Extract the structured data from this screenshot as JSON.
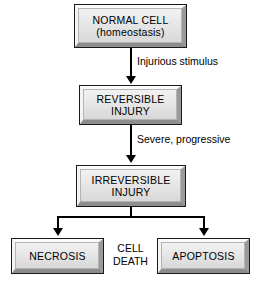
{
  "diagram": {
    "type": "flowchart",
    "colors": {
      "box_fill": "#e9e9e9",
      "box_border": "#1a1a1a",
      "bevel_light": "#fbfbfb",
      "bevel_dark": "#8d8d8d",
      "connector": "#000000",
      "text": "#000000",
      "background": "#ffffff"
    },
    "nodes": [
      {
        "id": "normal-cell",
        "label": "NORMAL CELL\n(homeostasis)"
      },
      {
        "id": "reversible-injury",
        "label": "REVERSIBLE\nINJURY"
      },
      {
        "id": "irreversible-injury",
        "label": "IRREVERSIBLE\nINJURY"
      },
      {
        "id": "necrosis",
        "label": "NECROSIS"
      },
      {
        "id": "apoptosis",
        "label": "APOPTOSIS"
      }
    ],
    "edge_labels": [
      {
        "id": "injurious-stimulus",
        "text": "Injurious stimulus"
      },
      {
        "id": "severe-progressive",
        "text": "Severe, progressive"
      }
    ],
    "center_label": {
      "id": "cell-death",
      "text": "CELL\nDEATH"
    }
  }
}
